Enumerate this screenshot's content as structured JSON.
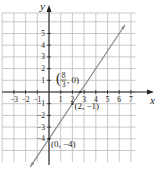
{
  "graph": {
    "x_axis_label": "x",
    "y_axis_label": "y",
    "x_ticks": [
      "−3",
      "−2",
      "−1",
      "1",
      "2",
      "3",
      "4",
      "5",
      "6",
      "7"
    ],
    "x_tick_values": [
      -3,
      -2,
      -1,
      1,
      2,
      3,
      4,
      5,
      6,
      7
    ],
    "y_ticks": [
      "5",
      "4",
      "3",
      "2",
      "1",
      "−1",
      "−2",
      "−3",
      "−4"
    ],
    "y_tick_values": [
      5,
      4,
      3,
      2,
      1,
      -1,
      -2,
      -3,
      -4
    ],
    "line": {
      "slope": 1.5,
      "intercept": -4,
      "equation": "y = (3/2)x − 4",
      "color": "#888888"
    },
    "points": [
      {
        "label": "(8/3, 0)",
        "num": "8",
        "den": "3",
        "x": 2.6667,
        "y": 0
      },
      {
        "label": "(2, −1)",
        "x": 2,
        "y": -1
      },
      {
        "label": "(0, −4)",
        "x": 0,
        "y": -4
      }
    ],
    "grid_color": "#bbbbbb",
    "axis_color": "#222222"
  }
}
